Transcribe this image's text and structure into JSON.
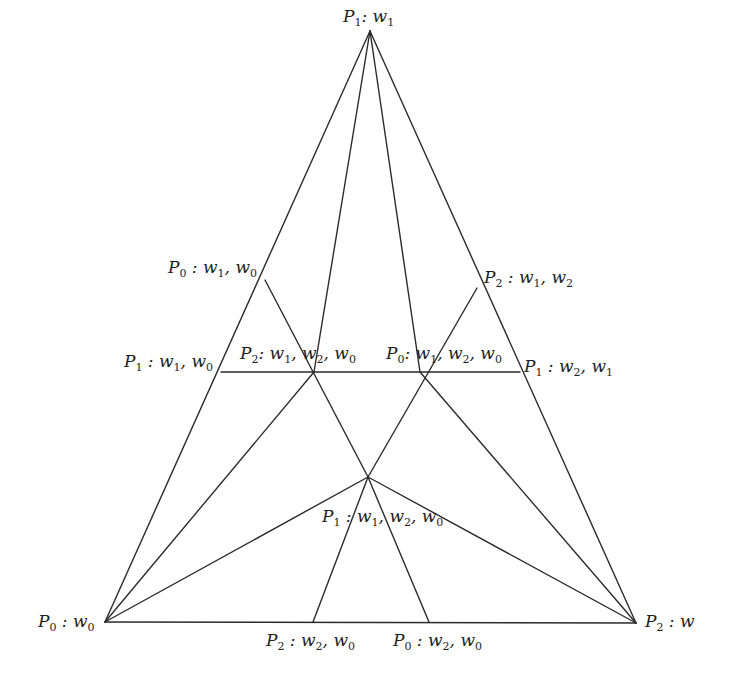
{
  "diagram": {
    "type": "triangulated simplex subdivision",
    "stroke_color": "#2b2b2b",
    "vertices": [
      {
        "id": "top",
        "x": 370,
        "y": 31,
        "label": {
          "P": "1",
          "w": [
            "1"
          ]
        },
        "text": "P1: w1"
      },
      {
        "id": "bottom-left",
        "x": 105,
        "y": 622,
        "label": {
          "P": "0",
          "w": [
            "0"
          ]
        },
        "text": "P0: w0"
      },
      {
        "id": "bottom-right",
        "x": 636,
        "y": 623,
        "label": {
          "P": "2",
          "w": []
        },
        "text": "P2: w"
      },
      {
        "id": "left-upper",
        "x": 265,
        "y": 280,
        "text": "P0: w1, w0"
      },
      {
        "id": "right-upper",
        "x": 477,
        "y": 288,
        "text": "P2: w1, w2"
      },
      {
        "id": "left-mid",
        "x": 221,
        "y": 372,
        "text": "P1: w1, w0"
      },
      {
        "id": "right-mid",
        "x": 520,
        "y": 372,
        "text": "P1: w2, w1"
      },
      {
        "id": "inner-left",
        "x": 314,
        "y": 372,
        "text": "P2: w1, w2, w0"
      },
      {
        "id": "inner-right",
        "x": 420,
        "y": 372,
        "text": "P0: w1, w2, w0"
      },
      {
        "id": "center",
        "x": 368,
        "y": 477,
        "text": "P1: w1, w2, w0"
      },
      {
        "id": "bottom-mid-left",
        "x": 313,
        "y": 622,
        "text": "P2: w2, w0"
      },
      {
        "id": "bottom-mid-right",
        "x": 429,
        "y": 622,
        "text": "P0: w2, w0"
      }
    ],
    "labels": {
      "top": {
        "p": "P",
        "psub": "1",
        "rest": [
          [
            "w",
            "1"
          ]
        ]
      },
      "left_upper": {
        "p": "P",
        "psub": "0",
        "rest": [
          [
            "w",
            "1"
          ],
          [
            "w",
            "0"
          ]
        ]
      },
      "right_upper": {
        "p": "P",
        "psub": "2",
        "rest": [
          [
            "w",
            "1"
          ],
          [
            "w",
            "2"
          ]
        ]
      },
      "left_mid": {
        "p": "P",
        "psub": "1",
        "rest": [
          [
            "w",
            "1"
          ],
          [
            "w",
            "0"
          ]
        ]
      },
      "right_mid": {
        "p": "P",
        "psub": "1",
        "rest": [
          [
            "w",
            "2"
          ],
          [
            "w",
            "1"
          ]
        ]
      },
      "inner_left": {
        "p": "P",
        "psub": "2",
        "rest": [
          [
            "w",
            "1"
          ],
          [
            "w",
            "2"
          ],
          [
            "w",
            "0"
          ]
        ]
      },
      "inner_right": {
        "p": "P",
        "psub": "0",
        "rest": [
          [
            "w",
            "1"
          ],
          [
            "w",
            "2"
          ],
          [
            "w",
            "0"
          ]
        ]
      },
      "center": {
        "p": "P",
        "psub": "1",
        "rest": [
          [
            "w",
            "1"
          ],
          [
            "w",
            "2"
          ],
          [
            "w",
            "0"
          ]
        ]
      },
      "bottom_left": {
        "p": "P",
        "psub": "0",
        "rest": [
          [
            "w",
            "0"
          ]
        ]
      },
      "bottom_right": {
        "p": "P",
        "psub": "2",
        "rest": [
          [
            "w",
            ""
          ]
        ]
      },
      "bottom_mid_left": {
        "p": "P",
        "psub": "2",
        "rest": [
          [
            "w",
            "2"
          ],
          [
            "w",
            "0"
          ]
        ]
      },
      "bottom_mid_right": {
        "p": "P",
        "psub": "0",
        "rest": [
          [
            "w",
            "2"
          ],
          [
            "w",
            "0"
          ]
        ]
      }
    },
    "edges": [
      [
        370,
        31,
        105,
        622
      ],
      [
        370,
        31,
        636,
        623
      ],
      [
        105,
        622,
        636,
        623
      ],
      [
        370,
        31,
        314,
        372
      ],
      [
        370,
        31,
        420,
        372
      ],
      [
        265,
        280,
        368,
        477
      ],
      [
        477,
        288,
        368,
        477
      ],
      [
        221,
        372,
        520,
        372
      ],
      [
        105,
        622,
        314,
        372
      ],
      [
        105,
        622,
        368,
        477
      ],
      [
        636,
        623,
        420,
        372
      ],
      [
        636,
        623,
        368,
        477
      ],
      [
        368,
        477,
        313,
        622
      ],
      [
        368,
        477,
        429,
        622
      ]
    ]
  }
}
